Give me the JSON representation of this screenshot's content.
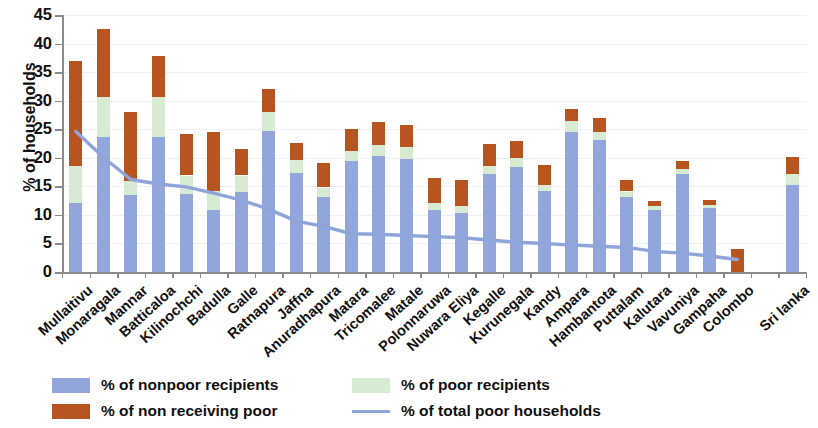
{
  "chart_data": {
    "type": "bar",
    "stacked": true,
    "title": "",
    "xlabel": "",
    "ylabel": "% of households",
    "ylim": [
      0,
      45
    ],
    "yticks": [
      0,
      5,
      10,
      15,
      20,
      25,
      30,
      35,
      40,
      45
    ],
    "grid": true,
    "legend_position": "bottom",
    "categories": [
      "Mullaitivu",
      "Monaragala",
      "Mannar",
      "Batticaloa",
      "Kilinochchi",
      "Badulla",
      "Galle",
      "Ratnapura",
      "Jaffna",
      "Anuradhapura",
      "Matara",
      "Tricomalee",
      "Matale",
      "Polonnaruwa",
      "Nuwara Eliya",
      "Kegalle",
      "Kurunegala",
      "Kandy",
      "Ampara",
      "Hambantota",
      "Puttalam",
      "Kalutara",
      "Vavuniya",
      "Gampaha",
      "Colombo",
      "",
      "Sri lanka"
    ],
    "series": [
      {
        "name": "% of nonpoor recipients",
        "color": "#93a6dc",
        "values": [
          12.0,
          23.7,
          13.4,
          23.7,
          13.6,
          10.8,
          14.0,
          24.7,
          17.4,
          13.2,
          19.4,
          20.3,
          19.8,
          10.8,
          10.3,
          17.2,
          18.4,
          14.1,
          24.6,
          23.1,
          13.2,
          10.8,
          17.2,
          11.2,
          0.0,
          null,
          15.2
        ]
      },
      {
        "name": "% of poor recipients",
        "color": "#d7ead2",
        "values": [
          6.5,
          7.0,
          2.6,
          7.0,
          3.3,
          3.4,
          2.9,
          3.4,
          2.3,
          1.6,
          1.8,
          1.9,
          2.1,
          1.3,
          1.2,
          1.4,
          1.5,
          1.2,
          1.8,
          1.5,
          0.9,
          0.7,
          0.8,
          0.6,
          0.0,
          null,
          2.0
        ]
      },
      {
        "name": "% of non receiving poor",
        "color": "#b8541f",
        "values": [
          18.5,
          11.8,
          12.1,
          7.2,
          7.2,
          10.4,
          4.7,
          4.0,
          2.9,
          4.3,
          3.9,
          4.0,
          3.8,
          4.3,
          4.7,
          3.9,
          3.0,
          3.5,
          2.2,
          2.3,
          2.1,
          1.0,
          1.5,
          0.8,
          4.0,
          null,
          3.0
        ]
      }
    ],
    "line_series": {
      "name": "% of total poor households",
      "color": "#8fa5da",
      "values": [
        24.6,
        20.1,
        16.2,
        15.4,
        14.9,
        13.8,
        12.6,
        11.0,
        8.9,
        8.0,
        6.7,
        6.6,
        6.4,
        6.2,
        6.0,
        5.6,
        5.2,
        5.0,
        4.7,
        4.5,
        4.3,
        3.6,
        3.3,
        2.8,
        2.2,
        null,
        null
      ]
    }
  },
  "legend": {
    "items": [
      {
        "label": "% of nonpoor recipients",
        "swatch": "nonpoor"
      },
      {
        "label": "% of poor recipients",
        "swatch": "poorrec"
      },
      {
        "label": "% of non receiving poor",
        "swatch": "nonrec"
      },
      {
        "label": "% of total poor households",
        "swatch": "line"
      }
    ]
  },
  "axis": {
    "y_title": "% of households"
  }
}
